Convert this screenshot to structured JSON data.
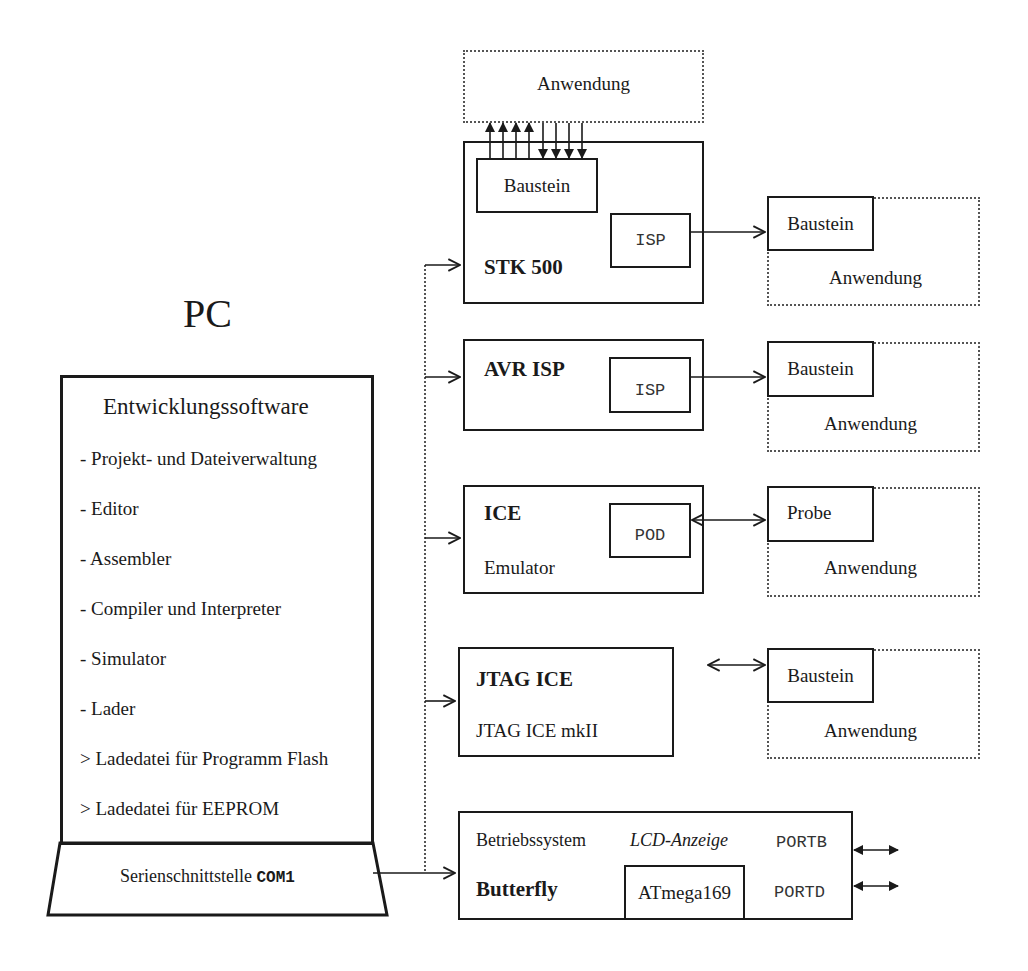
{
  "pc": {
    "title": "PC",
    "software_title": "Entwicklungssoftware",
    "items": [
      "- Projekt- und Dateiverwaltung",
      "- Editor",
      "- Assembler",
      "- Compiler und Interpreter",
      "- Simulator",
      "- Lader",
      "> Ladedatei für Programm Flash",
      "> Ladedatei für EEPROM"
    ],
    "serial_label": "Serienschnittstelle",
    "serial_port": "COM1"
  },
  "stk500": {
    "title": "STK 500",
    "chip": "Baustein",
    "isp": "ISP",
    "application_top": "Anwendung",
    "target_chip": "Baustein",
    "target_application": "Anwendung"
  },
  "avr_isp": {
    "title": "AVR ISP",
    "isp": "ISP",
    "target_chip": "Baustein",
    "target_application": "Anwendung"
  },
  "ice": {
    "title": "ICE",
    "subtitle": "Emulator",
    "pod": "POD",
    "target_probe": "Probe",
    "target_application": "Anwendung"
  },
  "jtag": {
    "title": "JTAG ICE",
    "subtitle": "JTAG ICE mkII",
    "target_chip": "Baustein",
    "target_application": "Anwendung"
  },
  "butterfly": {
    "title": "Butterfly",
    "os": "Betriebssystem",
    "lcd": "LCD-Anzeige",
    "mcu": "ATmega169",
    "port_b": "PORTB",
    "port_d": "PORTD"
  }
}
